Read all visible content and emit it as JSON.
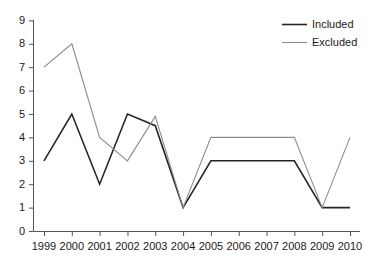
{
  "chart_data": {
    "type": "line",
    "title": "",
    "xlabel": "",
    "ylabel": "",
    "categories": [
      "1999",
      "2000",
      "2001",
      "2002",
      "2003",
      "2004",
      "2005",
      "2006",
      "2007",
      "2008",
      "2009",
      "2010"
    ],
    "series": [
      {
        "name": "Included",
        "color": "#262626",
        "values": [
          3,
          5,
          2,
          5,
          4.5,
          1,
          3,
          3,
          3,
          3,
          1,
          1
        ]
      },
      {
        "name": "Excluded",
        "color": "#8c8c8c",
        "values": [
          7,
          8,
          4,
          3,
          4.9,
          1,
          4,
          4,
          4,
          4,
          1,
          4
        ]
      }
    ],
    "ylim": [
      0,
      9
    ],
    "yticks": [
      0,
      1,
      2,
      3,
      4,
      5,
      6,
      7,
      8,
      9
    ],
    "ytick_labels": [
      "0",
      "1",
      "2",
      "3",
      "4",
      "5",
      "6",
      "7",
      "8",
      "9"
    ],
    "grid": false,
    "legend_position": "top-right"
  },
  "legend": {
    "entries": [
      {
        "label": "Included"
      },
      {
        "label": "Excluded"
      }
    ]
  },
  "axes": {
    "y_labels": [
      "9",
      "8",
      "7",
      "6",
      "5",
      "4",
      "3",
      "2",
      "1",
      "0"
    ],
    "x_labels": [
      "1999",
      "2000",
      "2001",
      "2002",
      "2003",
      "2004",
      "2005",
      "2006",
      "2007",
      "2008",
      "2009",
      "2010"
    ]
  }
}
